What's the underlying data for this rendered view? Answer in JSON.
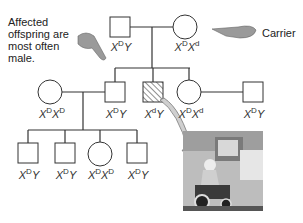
{
  "annotations": {
    "affected_note": "Affected offspring are most often male.",
    "carrier_label": "Carrier"
  },
  "pedigree": {
    "gen1": [
      {
        "sex": "male",
        "status": "unaffected",
        "allele1": "D",
        "base": "X",
        "second": "Y",
        "sup2": ""
      },
      {
        "sex": "female",
        "status": "carrier",
        "allele1": "D",
        "base": "X",
        "second": "X",
        "sup2": "d"
      }
    ],
    "gen2": [
      {
        "sex": "female",
        "status": "unaffected",
        "allele1": "D",
        "second": "X",
        "sup2": "D"
      },
      {
        "sex": "male",
        "status": "unaffected",
        "allele1": "D",
        "second": "Y",
        "sup2": ""
      },
      {
        "sex": "male",
        "status": "affected",
        "allele1": "d",
        "second": "Y",
        "sup2": ""
      },
      {
        "sex": "female",
        "status": "carrier",
        "allele1": "D",
        "second": "X",
        "sup2": "d"
      },
      {
        "sex": "male",
        "status": "unaffected",
        "allele1": "D",
        "second": "Y",
        "sup2": ""
      }
    ],
    "gen3": [
      {
        "sex": "male",
        "status": "unaffected",
        "allele1": "D",
        "second": "Y",
        "sup2": ""
      },
      {
        "sex": "male",
        "status": "unaffected",
        "allele1": "D",
        "second": "Y",
        "sup2": ""
      },
      {
        "sex": "female",
        "status": "unaffected",
        "allele1": "D",
        "second": "X",
        "sup2": "D"
      },
      {
        "sex": "male",
        "status": "unaffected",
        "allele1": "D",
        "second": "Y",
        "sup2": ""
      }
    ]
  },
  "symbols": {
    "X": "X",
    "Y": "Y"
  },
  "photo": {
    "description": "person in motorized wheelchair using an ATM"
  },
  "colors": {
    "line": "#333333",
    "hatch": "#555555",
    "arrow_fill": "#cfcfcf"
  }
}
